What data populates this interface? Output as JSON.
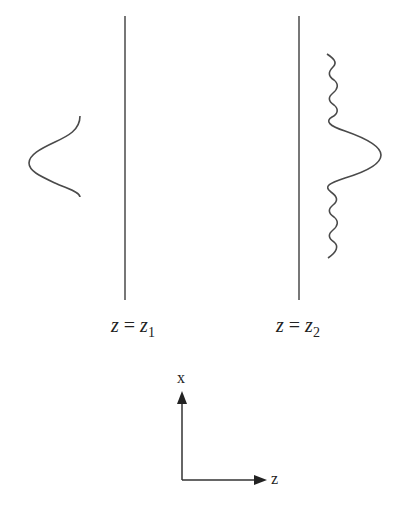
{
  "diagram": {
    "planes": [
      {
        "label_var": "z",
        "label_eq": "=",
        "label_rhs": "z",
        "label_sub": "1"
      },
      {
        "label_var": "z",
        "label_eq": "=",
        "label_rhs": "z",
        "label_sub": "2"
      }
    ],
    "pulses": [
      {
        "name": "input-gaussian-pulse",
        "shape": "smooth gaussian"
      },
      {
        "name": "output-pulse-with-ringing",
        "shape": "gaussian with oscillating tails"
      }
    ],
    "axes": {
      "vertical_label": "x",
      "horizontal_label": "z"
    },
    "colors": {
      "stroke": "#4a4a4a",
      "text": "#222222",
      "background": "#ffffff"
    }
  }
}
